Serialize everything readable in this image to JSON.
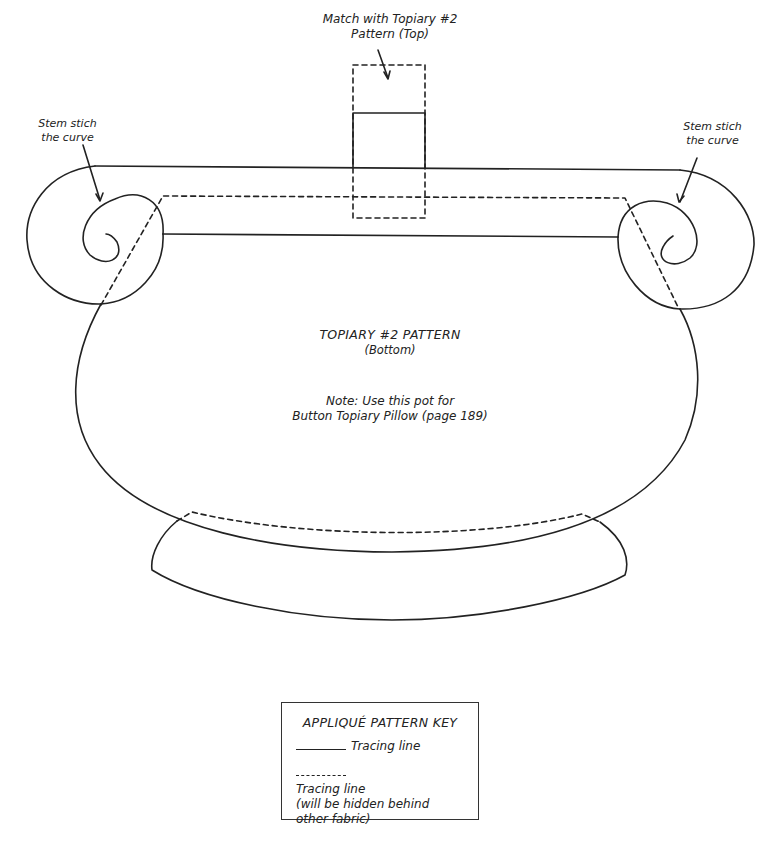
{
  "labels": {
    "match_top": "Match with Topiary #2\nPattern (Top)",
    "match_top_line1": "Match with Topiary #2",
    "match_top_line2": "Pattern (Top)",
    "stem_left_line1": "Stem stich",
    "stem_left_line2": "the curve",
    "stem_right_line1": "Stem stich",
    "stem_right_line2": "the curve",
    "pattern_title": "TOPIARY #2 PATTERN",
    "pattern_subtitle": "(Bottom)",
    "note_line1": "Note: Use this pot for",
    "note_line2": "Button Topiary Pillow (page 189)"
  },
  "key": {
    "title": "APPLIQUÉ PATTERN KEY",
    "solid_label": "Tracing line",
    "dashed_label_line1": "Tracing line",
    "dashed_label_line2": "(will be hidden behind",
    "dashed_label_line3": "other fabric)"
  },
  "colors": {
    "line": "#222222",
    "background": "#ffffff"
  }
}
